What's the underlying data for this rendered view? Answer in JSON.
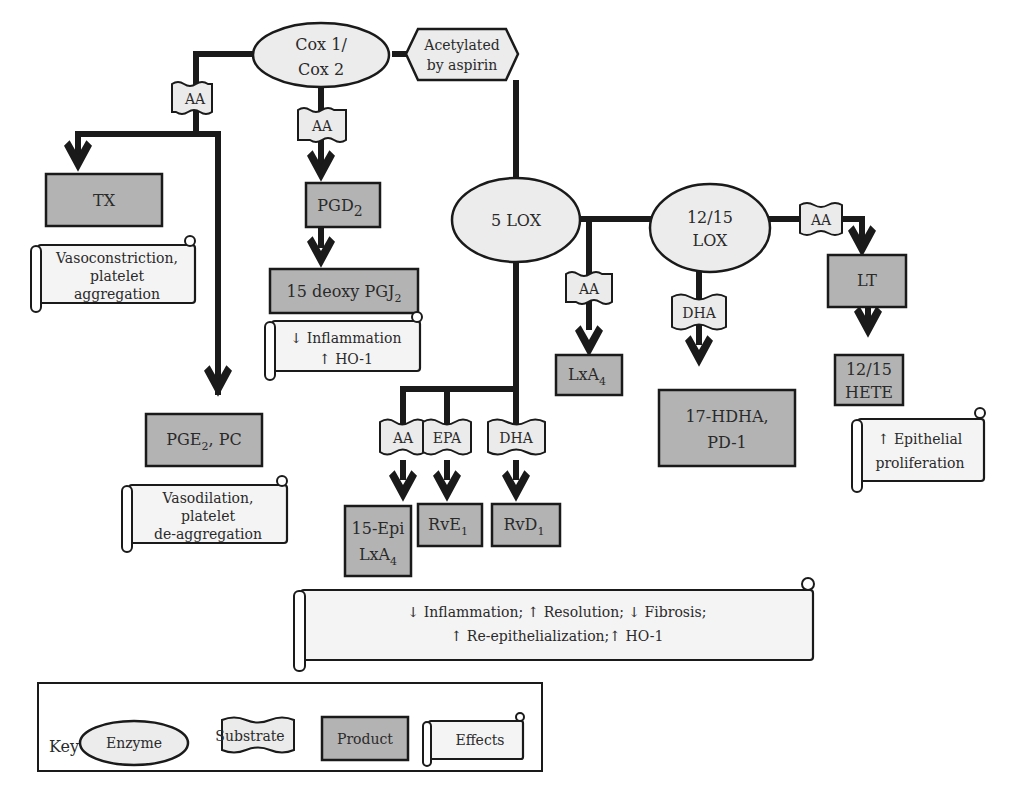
{
  "diagram": {
    "enzymes": {
      "cox": {
        "line1": "Cox 1/",
        "line2": "Cox 2"
      },
      "lox5": {
        "label": "5 LOX"
      },
      "lox1215": {
        "line1": "12/15",
        "line2": "LOX"
      }
    },
    "modifier": {
      "line1": "Acetylated",
      "line2": "by aspirin"
    },
    "substrates": {
      "aa_left": "AA",
      "aa_cox": "AA",
      "aa_lxa4": "AA",
      "aa_lt": "AA",
      "dha_1215": "DHA",
      "aa_bottom": "AA",
      "epa_bottom": "EPA",
      "dha_bottom": "DHA"
    },
    "products": {
      "tx": {
        "label": "TX"
      },
      "pgd2": {
        "base": "PGD",
        "sub": "2"
      },
      "deoxy_pgj2": {
        "base": "15 deoxy PGJ",
        "sub": "2"
      },
      "pge2_pc": {
        "base": "PGE",
        "sub": "2",
        "tail": ", PC"
      },
      "lxa4": {
        "base": "LxA",
        "sub": "4"
      },
      "hdha_pd1": {
        "line1": "17-HDHA,",
        "line2": "PD-1"
      },
      "lt": {
        "label": "LT"
      },
      "hete": {
        "line1": "12/15",
        "line2": "HETE"
      },
      "epi_lxa4": {
        "line1": "15-Epi",
        "base": "LxA",
        "sub": "4"
      },
      "rve1": {
        "base": "RvE",
        "sub": "1"
      },
      "rvd1": {
        "base": "RvD",
        "sub": "1"
      }
    },
    "effects": {
      "tx": {
        "line1": "Vasoconstriction,",
        "line2": "platelet",
        "line3": "aggregation"
      },
      "pgj2": {
        "line1": "↓ Inflammation",
        "line2": "↑ HO-1"
      },
      "pge2": {
        "line1": "Vasodilation,",
        "line2": "platelet",
        "line3": "de-aggregation"
      },
      "hete": {
        "line1": "↑ Epithelial",
        "line2": "proliferation"
      },
      "resolution": {
        "line1": "↓ Inflammation; ↑ Resolution; ↓ Fibrosis;",
        "line2": "↑ Re-epithelialization;↑ HO-1"
      }
    }
  },
  "key": {
    "title": "Key",
    "enzyme": "Enzyme",
    "substrate": "Substrate",
    "product": "Product",
    "effects": "Effects"
  },
  "colors": {
    "product_fill": "#b3b3b3",
    "enzyme_fill": "#ececec",
    "effect_fill": "#f4f4f4",
    "line": "#1a1a1a"
  }
}
